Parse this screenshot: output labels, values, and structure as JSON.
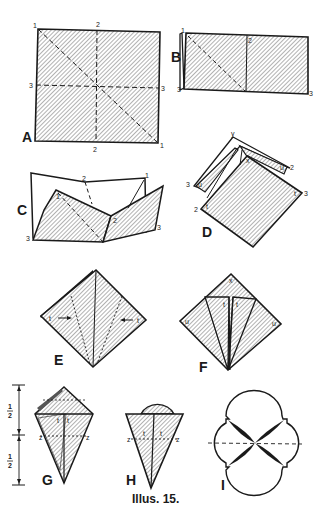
{
  "figure": {
    "caption": "Illus. 15.",
    "ink_color": "#1a1a1a",
    "background": "#ffffff"
  },
  "steps": {
    "A": {
      "label": "A",
      "points": {
        "tl": "1",
        "top": "2",
        "left": "3",
        "right": "3",
        "bottom": "2",
        "br": "1"
      }
    },
    "B": {
      "label": "B",
      "points": {
        "tl": "1",
        "mid": "2",
        "bl": "3",
        "br": "3"
      }
    },
    "C": {
      "label": "C",
      "points": {
        "top_mid": "2",
        "top_right": "1",
        "inner_left": "1",
        "inner_mid": "2",
        "bl": "3",
        "br": "3"
      }
    },
    "D": {
      "label": "D",
      "points": {
        "apex": "y",
        "left_outer": "3",
        "left_inner": "u",
        "inner_x": "x",
        "right_u": "u",
        "right_2": "2",
        "bl_outer": "2",
        "bl_inner": "t",
        "br_inner": "t",
        "br_outer": "3"
      }
    },
    "E": {
      "label": "E",
      "points": {
        "left": "t",
        "right": "t"
      }
    },
    "F": {
      "label": "F",
      "points": {
        "top": "x",
        "left": "u",
        "right": "u",
        "center_left": "t",
        "center_right": "t"
      }
    },
    "G": {
      "label": "G",
      "points": {
        "upper_left": "t",
        "upper_right": "t",
        "z_left": "z",
        "z_right": "z"
      },
      "dimensions": {
        "upper": "1/2",
        "lower": "1/2"
      }
    },
    "H": {
      "label": "H",
      "points": {
        "z_left": "z",
        "z_right": "z",
        "inner_left": "t",
        "inner_right": "t"
      }
    },
    "I": {
      "label": "I"
    }
  }
}
